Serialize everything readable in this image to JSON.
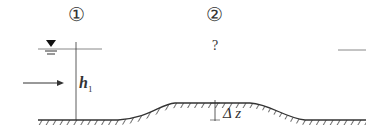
{
  "sections": [
    {
      "label": "①"
    },
    {
      "label": "②"
    }
  ],
  "unknown_depth": "?",
  "depth_label": {
    "main": "h",
    "sub": "1"
  },
  "hump_label": "Δ z",
  "colors": {
    "line": "#333333",
    "water_line": "#888888"
  }
}
